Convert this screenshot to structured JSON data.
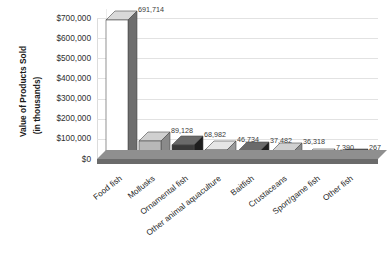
{
  "chart_data": {
    "type": "bar",
    "title": "",
    "subtitle": "",
    "xlabel": "",
    "ylabel": "Value of Products Sold (in thousands)",
    "ylabel_line1": "Value of Products Sold",
    "ylabel_line2": "(in thousands)",
    "categories": [
      "Food fish",
      "Mollusks",
      "Ornamental fish",
      "Other animal aquaculture",
      "Baitfish",
      "Crustaceans",
      "Sport/game fish",
      "Other fish"
    ],
    "values": [
      691714,
      89128,
      68982,
      46734,
      37482,
      36318,
      7390,
      267
    ],
    "value_labels": [
      "691,714",
      "89,128",
      "68,982",
      "46,734",
      "37,482",
      "36,318",
      "7,390",
      "267"
    ],
    "ylim": [
      0,
      700000
    ],
    "ytick_values": [
      0,
      100000,
      200000,
      300000,
      400000,
      500000,
      600000,
      700000
    ],
    "ytick_labels": [
      "$0",
      "$100,000",
      "$200,000",
      "$300,000",
      "$400,000",
      "$500,000",
      "$600,000",
      "$700,000"
    ],
    "grid": true,
    "legend": "none",
    "style": "3d-column",
    "bar_face_colors": [
      "#ffffff",
      "#b8b8b8",
      "#3a3a3a",
      "#ffffff",
      "#3a3a3a",
      "#b8b8b8",
      "#ffffff",
      "#2e2e2e"
    ],
    "bar_side_colors": [
      "#6e6e6e",
      "#8a8a8a",
      "#1f1f1f",
      "#9a9a9a",
      "#1f1f1f",
      "#8a8a8a",
      "#9a9a9a",
      "#141414"
    ],
    "bar_top_colors": [
      "#d9d9d9",
      "#d0d0d0",
      "#6a6a6a",
      "#e6e6e6",
      "#6a6a6a",
      "#d0d0d0",
      "#e6e6e6",
      "#555555"
    ],
    "floor_color": "#7d7d7d",
    "gridline_color": "#e2e2e2"
  }
}
